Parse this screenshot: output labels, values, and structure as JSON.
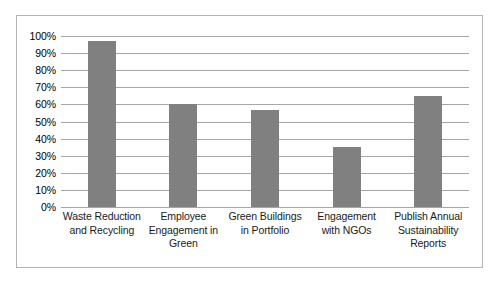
{
  "chart_data": {
    "type": "bar",
    "title": "",
    "subtitle": "",
    "xlabel": "",
    "ylabel": "",
    "categories": [
      "Waste Reduction and Recycling",
      "Employee Engagement in Green",
      "Green Buildings in Portfolio",
      "Engagement with NGOs",
      "Publish Annual Sustainability Reports"
    ],
    "values": [
      97,
      60,
      57,
      35,
      65
    ],
    "value_labels": [
      "97%",
      "60%",
      "57%",
      "35%",
      "65%"
    ],
    "ylim": [
      0,
      100
    ],
    "y_tick_labels": [
      "100%",
      "90%",
      "80%",
      "70%",
      "60%",
      "50%",
      "40%",
      "30%",
      "20%",
      "10%",
      "0%"
    ],
    "y_tick_values": [
      100,
      90,
      80,
      70,
      60,
      50,
      40,
      30,
      20,
      10,
      0
    ],
    "grid": true,
    "legend": false,
    "legend_position": "none",
    "bar_color": "#808080",
    "gridline_color": "#a6a6a6",
    "frame_color": "#b3b3b3",
    "background_color": "#ffffff"
  }
}
